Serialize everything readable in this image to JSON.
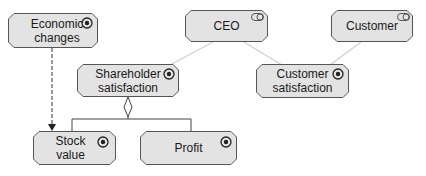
{
  "colors": {
    "node_fill": "#e3e3e3",
    "node_border": "#555555",
    "assoc_line": "#cfcfcf",
    "edge_dark": "#333333",
    "text": "#1a1a1a"
  },
  "nodes": [
    {
      "id": "economic-changes",
      "label_line1": "Economic",
      "label_line2": "changes",
      "icon": "goal-gear-icon",
      "x": 8,
      "y": 13,
      "w": 90,
      "h": 35
    },
    {
      "id": "ceo",
      "label_line1": "CEO",
      "label_line2": "",
      "icon": "stakeholder-toggle-icon",
      "x": 185,
      "y": 10,
      "w": 83,
      "h": 32
    },
    {
      "id": "customer",
      "label_line1": "Customer",
      "label_line2": "",
      "icon": "stakeholder-toggle-icon",
      "x": 331,
      "y": 10,
      "w": 82,
      "h": 32
    },
    {
      "id": "shareholder-satisfaction",
      "label_line1": "Shareholder",
      "label_line2": "satisfaction",
      "icon": "goal-gear-icon",
      "x": 77,
      "y": 64,
      "w": 102,
      "h": 33
    },
    {
      "id": "customer-satisfaction",
      "label_line1": "Customer",
      "label_line2": "satisfaction",
      "icon": "goal-gear-icon",
      "x": 256,
      "y": 64,
      "w": 93,
      "h": 34
    },
    {
      "id": "stock-value",
      "label_line1": "Stock",
      "label_line2": "value",
      "icon": "goal-gear-icon",
      "x": 33,
      "y": 131,
      "w": 83,
      "h": 34
    },
    {
      "id": "profit",
      "label_line1": "Profit",
      "label_line2": "",
      "icon": "goal-gear-icon",
      "x": 140,
      "y": 131,
      "w": 97,
      "h": 34
    }
  ],
  "edges": [
    {
      "type": "association",
      "from": "ceo",
      "to": "shareholder-satisfaction"
    },
    {
      "type": "association",
      "from": "ceo",
      "to": "customer-satisfaction"
    },
    {
      "type": "association",
      "from": "customer",
      "to": "customer-satisfaction"
    },
    {
      "type": "influence-dashed-arrow",
      "from": "economic-changes",
      "to": "stock-value"
    },
    {
      "type": "aggregation",
      "from": "shareholder-satisfaction",
      "to": [
        "stock-value",
        "profit"
      ]
    }
  ]
}
